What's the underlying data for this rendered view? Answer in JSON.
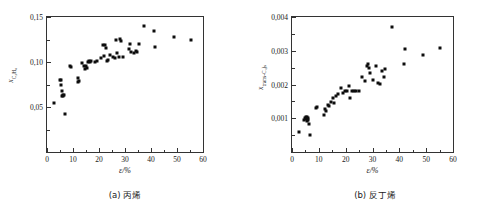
{
  "figure": {
    "panels": [
      {
        "id": "panel-a",
        "caption": "(a) 丙烯",
        "xaxis_title": "ε/%",
        "yaxis_title_main": "x",
        "yaxis_title_sub": "C₃H₆",
        "xticklabels": [
          "0",
          "10",
          "20",
          "30",
          "40",
          "50",
          "60"
        ],
        "yticklabels": [
          "0,05",
          "0,10",
          "0,15"
        ]
      },
      {
        "id": "panel-b",
        "caption": "(b) 反丁烯",
        "xaxis_title": "ε/%",
        "yaxis_title_main": "x",
        "yaxis_title_sub": "trans-C₄)ₛ",
        "xticklabels": [
          "0",
          "10",
          "20",
          "30",
          "40",
          "50",
          "60"
        ],
        "yticklabels": [
          "0,001",
          "0,002",
          "0,003",
          "0,004"
        ]
      }
    ]
  },
  "chart_data": [
    {
      "type": "scatter",
      "panel": "(a) 丙烯",
      "title": "",
      "xlabel": "ε/%",
      "ylabel": "x_C3H6",
      "xlim": [
        0,
        60
      ],
      "ylim": [
        0,
        0.15
      ],
      "xticks": [
        0,
        10,
        20,
        30,
        40,
        50,
        60
      ],
      "yticks": [
        0.05,
        0.1,
        0.15
      ],
      "grid": false,
      "legend": null,
      "marker": "filled-square",
      "marker_color": "#0d0d0d",
      "points": [
        [
          2.6,
          0.0545
        ],
        [
          4.9,
          0.0795
        ],
        [
          5.2,
          0.0805
        ],
        [
          5.4,
          0.0745
        ],
        [
          5.6,
          0.0675
        ],
        [
          5.9,
          0.0625
        ],
        [
          6.1,
          0.0635
        ],
        [
          6.3,
          0.062
        ],
        [
          6.6,
          0.063
        ],
        [
          6.8,
          0.0425
        ],
        [
          8.9,
          0.0955
        ],
        [
          9.3,
          0.095
        ],
        [
          11.8,
          0.082
        ],
        [
          12.0,
          0.0775
        ],
        [
          12.3,
          0.079
        ],
        [
          13.6,
          0.0985
        ],
        [
          14.2,
          0.096
        ],
        [
          14.6,
          0.0925
        ],
        [
          15.0,
          0.0955
        ],
        [
          15.4,
          0.0935
        ],
        [
          15.8,
          0.1
        ],
        [
          16.2,
          0.101
        ],
        [
          16.6,
          0.0995
        ],
        [
          17.0,
          0.1015
        ],
        [
          18.4,
          0.1005
        ],
        [
          19.2,
          0.101
        ],
        [
          20.6,
          0.104
        ],
        [
          21.4,
          0.1185
        ],
        [
          21.8,
          0.1065
        ],
        [
          22.3,
          0.119
        ],
        [
          22.6,
          0.116
        ],
        [
          23.0,
          0.1015
        ],
        [
          23.5,
          0.1025
        ],
        [
          24.4,
          0.1075
        ],
        [
          25.2,
          0.106
        ],
        [
          26.0,
          0.1045
        ],
        [
          26.6,
          0.1245
        ],
        [
          27.0,
          0.1105
        ],
        [
          27.6,
          0.106
        ],
        [
          28.2,
          0.1255
        ],
        [
          28.6,
          0.123
        ],
        [
          29.2,
          0.106
        ],
        [
          31.4,
          0.114
        ],
        [
          31.8,
          0.12
        ],
        [
          32.4,
          0.1115
        ],
        [
          33.6,
          0.1105
        ],
        [
          34.2,
          0.1125
        ],
        [
          34.6,
          0.111
        ],
        [
          35.2,
          0.1195
        ],
        [
          37.2,
          0.14
        ],
        [
          41.2,
          0.1345
        ],
        [
          41.6,
          0.1165
        ],
        [
          48.8,
          0.128
        ],
        [
          55.2,
          0.125
        ]
      ]
    },
    {
      "type": "scatter",
      "panel": "(b) 反丁烯",
      "title": "",
      "xlabel": "ε/%",
      "ylabel": "x_trans-C4",
      "xlim": [
        0,
        60
      ],
      "ylim": [
        0,
        0.004
      ],
      "xticks": [
        0,
        10,
        20,
        30,
        40,
        50,
        60
      ],
      "yticks": [
        0.001,
        0.002,
        0.003,
        0.004
      ],
      "grid": false,
      "legend": null,
      "marker": "filled-square",
      "marker_color": "#0d0d0d",
      "points": [
        [
          2.6,
          0.0006
        ],
        [
          4.6,
          0.00096
        ],
        [
          4.9,
          0.001
        ],
        [
          5.1,
          0.00104
        ],
        [
          5.3,
          0.00098
        ],
        [
          5.5,
          0.00092
        ],
        [
          5.7,
          0.00105
        ],
        [
          5.9,
          0.001
        ],
        [
          6.1,
          0.00096
        ],
        [
          6.3,
          0.00082
        ],
        [
          6.6,
          0.00051
        ],
        [
          8.9,
          0.0013
        ],
        [
          9.3,
          0.00133
        ],
        [
          11.8,
          0.0011
        ],
        [
          12.2,
          0.00127
        ],
        [
          12.6,
          0.00121
        ],
        [
          13.4,
          0.0014
        ],
        [
          13.8,
          0.00137
        ],
        [
          14.6,
          0.00149
        ],
        [
          15.4,
          0.00159
        ],
        [
          15.8,
          0.00144
        ],
        [
          16.4,
          0.00166
        ],
        [
          17.2,
          0.00172
        ],
        [
          18.2,
          0.0019
        ],
        [
          19.0,
          0.00176
        ],
        [
          19.6,
          0.0018
        ],
        [
          20.6,
          0.00181
        ],
        [
          21.4,
          0.00195
        ],
        [
          21.8,
          0.0016
        ],
        [
          22.4,
          0.00182
        ],
        [
          23.0,
          0.0018
        ],
        [
          24.0,
          0.00181
        ],
        [
          25.0,
          0.00181
        ],
        [
          26.0,
          0.00222
        ],
        [
          27.2,
          0.00211
        ],
        [
          27.8,
          0.00256
        ],
        [
          28.2,
          0.00262
        ],
        [
          28.6,
          0.0025
        ],
        [
          29.2,
          0.00235
        ],
        [
          30.0,
          0.00214
        ],
        [
          31.4,
          0.00254
        ],
        [
          32.2,
          0.00205
        ],
        [
          32.8,
          0.00201
        ],
        [
          33.6,
          0.0024
        ],
        [
          34.2,
          0.00222
        ],
        [
          34.8,
          0.00245
        ],
        [
          37.4,
          0.0037
        ],
        [
          41.6,
          0.0026
        ],
        [
          42.0,
          0.00306
        ],
        [
          48.8,
          0.00286
        ],
        [
          55.2,
          0.00308
        ]
      ]
    }
  ]
}
